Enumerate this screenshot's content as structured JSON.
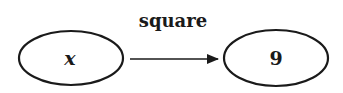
{
  "diagram": {
    "arrow_label": "square",
    "input_node": {
      "label": "x"
    },
    "output_node": {
      "label": "9"
    },
    "colors": {
      "stroke": "#1a1a1a",
      "background": "#ffffff"
    }
  }
}
